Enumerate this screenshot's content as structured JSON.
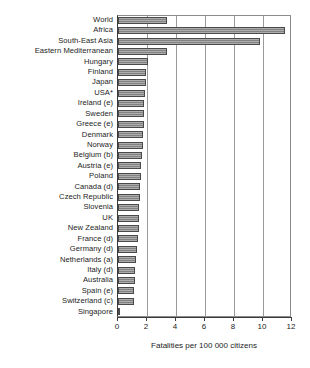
{
  "chart_data": {
    "type": "bar",
    "orientation": "horizontal",
    "title": "",
    "xlabel": "Fatalities per 100 000 citizens",
    "ylabel": "",
    "xlim": [
      0,
      12
    ],
    "xticks": [
      0,
      2,
      4,
      6,
      8,
      10,
      12
    ],
    "grid": true,
    "legend": null,
    "bar_color": "#8a8a8a",
    "bar_edge_color": "#4a4a4a",
    "categories": [
      "World",
      "Africa",
      "South-East Asia",
      "Eastern Mediterranean",
      "Hungary",
      "Finland",
      "Japan",
      "USA*",
      "Ireland (e)",
      "Sweden",
      "Greece (e)",
      "Denmark",
      "Norway",
      "Belgium (b)",
      "Austria (e)",
      "Poland",
      "Canada (d)",
      "Czech Republic",
      "Slovenia",
      "UK",
      "New Zealand",
      "France (d)",
      "Germany (d)",
      "Netherlands (a)",
      "Italy (d)",
      "Australia",
      "Spain (e)",
      "Switzerland (c)",
      "Singapore"
    ],
    "values": [
      3.4,
      11.5,
      9.8,
      3.4,
      2.1,
      1.9,
      1.9,
      1.85,
      1.8,
      1.8,
      1.8,
      1.75,
      1.7,
      1.65,
      1.6,
      1.6,
      1.55,
      1.55,
      1.45,
      1.45,
      1.45,
      1.4,
      1.3,
      1.25,
      1.2,
      1.15,
      1.1,
      1.1,
      0.1
    ]
  }
}
